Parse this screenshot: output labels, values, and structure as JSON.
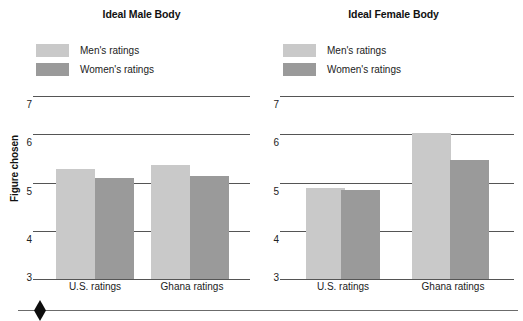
{
  "figure": {
    "y_axis_label": "Figure chosen",
    "y_ticks": [
      "7",
      "6",
      "5",
      "4",
      "3"
    ],
    "legend": [
      {
        "label": "Men's ratings",
        "color": "#c9c9c9",
        "swatch_name": "legend-swatch-mens"
      },
      {
        "label": "Women's ratings",
        "color": "#9a9a9a",
        "swatch_name": "legend-swatch-womens"
      }
    ],
    "bottom_marker": "diamond-marker"
  },
  "panels": [
    {
      "id": "male",
      "title": "Ideal Male Body"
    },
    {
      "id": "female",
      "title": "Ideal Female Body"
    }
  ],
  "chart_data": [
    {
      "type": "bar",
      "title": "Ideal Male Body",
      "xlabel": "",
      "ylabel": "Figure chosen",
      "ylim": [
        3,
        7
      ],
      "yticks": [
        3,
        4,
        5,
        6,
        7
      ],
      "grid": true,
      "legend_position": "top-left",
      "categories": [
        "U.S. ratings",
        "Ghana ratings"
      ],
      "series": [
        {
          "name": "Men's ratings",
          "color": "#c9c9c9",
          "values": [
            5.4,
            5.5
          ]
        },
        {
          "name": "Women's ratings",
          "color": "#9a9a9a",
          "values": [
            5.2,
            5.25
          ]
        }
      ]
    },
    {
      "type": "bar",
      "title": "Ideal Female Body",
      "xlabel": "",
      "ylabel": "Figure chosen",
      "ylim": [
        3,
        7
      ],
      "yticks": [
        3,
        4,
        5,
        6,
        7
      ],
      "grid": true,
      "legend_position": "top-left",
      "categories": [
        "U.S. ratings",
        "Ghana ratings"
      ],
      "series": [
        {
          "name": "Men's ratings",
          "color": "#c9c9c9",
          "values": [
            5.0,
            6.2
          ]
        },
        {
          "name": "Women's ratings",
          "color": "#9a9a9a",
          "values": [
            4.95,
            5.6
          ]
        }
      ]
    }
  ]
}
